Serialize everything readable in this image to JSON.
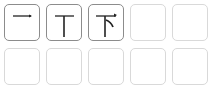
{
  "character": "下",
  "stroke_order": {
    "cells": [
      {
        "index": 1,
        "state": "filled",
        "glyph": "一",
        "strokes": 1
      },
      {
        "index": 2,
        "state": "filled",
        "glyph": "丅",
        "strokes": 2
      },
      {
        "index": 3,
        "state": "filled",
        "glyph": "下",
        "strokes": 3
      },
      {
        "index": 4,
        "state": "empty"
      },
      {
        "index": 5,
        "state": "empty"
      },
      {
        "index": 6,
        "state": "empty"
      },
      {
        "index": 7,
        "state": "empty"
      },
      {
        "index": 8,
        "state": "empty"
      },
      {
        "index": 9,
        "state": "empty"
      },
      {
        "index": 10,
        "state": "empty"
      }
    ]
  },
  "colors": {
    "filled_border": "#8c8c8c",
    "empty_border": "#d9d9d9",
    "stroke": "#222222"
  }
}
